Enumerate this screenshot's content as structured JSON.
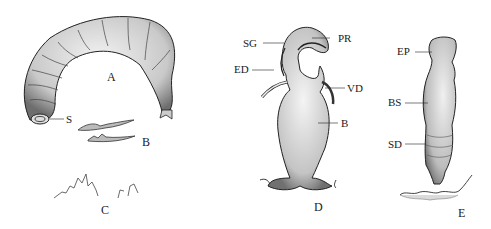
{
  "figure": {
    "panels": [
      {
        "id": "A",
        "label": "A",
        "subject": "larva",
        "callouts": [
          {
            "label": "S"
          }
        ]
      },
      {
        "id": "B",
        "label": "B",
        "subject": "mouth hooks"
      },
      {
        "id": "C",
        "label": "C",
        "subject": "spines"
      },
      {
        "id": "D",
        "label": "D",
        "subject": "male reproductive organ",
        "callouts": [
          {
            "label": "SG"
          },
          {
            "label": "PR"
          },
          {
            "label": "ED"
          },
          {
            "label": "VD"
          },
          {
            "label": "B"
          }
        ]
      },
      {
        "id": "E",
        "label": "E",
        "subject": "female reproductive organ",
        "callouts": [
          {
            "label": "EP"
          },
          {
            "label": "BS"
          },
          {
            "label": "SD"
          }
        ]
      }
    ]
  },
  "colors": {
    "ink": "#1a1a1a",
    "stipple": "#8a8a8a",
    "background": "#ffffff"
  }
}
